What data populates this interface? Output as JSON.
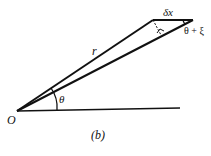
{
  "diagram": {
    "caption": "(b)",
    "labels": {
      "origin": "O",
      "radius": "r",
      "angle": "θ",
      "arc_segment": "δx",
      "outer_angle": "θ + ξ"
    },
    "colors": {
      "line": "#111111",
      "background": "#ffffff"
    }
  }
}
